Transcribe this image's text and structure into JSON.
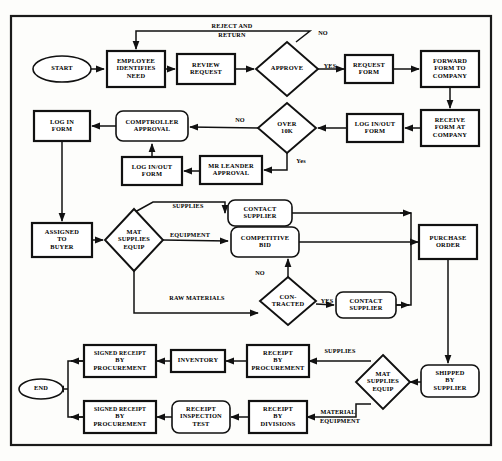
{
  "diagram": {
    "frame": {
      "x": 11,
      "y": 16,
      "w": 480,
      "h": 429
    },
    "colors": {
      "stroke": "#111111",
      "fill": "#ffffff",
      "background": "#fdfdfb"
    },
    "nodes": [
      {
        "id": "start",
        "type": "terminator",
        "cx": 62,
        "cy": 69,
        "w": 58,
        "h": 26,
        "lines": [
          "START"
        ]
      },
      {
        "id": "employee",
        "type": "process",
        "cx": 136,
        "cy": 69,
        "w": 58,
        "h": 36,
        "lines": [
          "EMPLOYEE",
          "IDENTIFIES",
          "NEED"
        ]
      },
      {
        "id": "review",
        "type": "process",
        "cx": 206,
        "cy": 69,
        "w": 58,
        "h": 30,
        "lines": [
          "REVIEW",
          "REQUEST"
        ]
      },
      {
        "id": "approve",
        "type": "decision",
        "cx": 287,
        "cy": 69,
        "w": 62,
        "h": 54,
        "lines": [
          "APPROVE"
        ]
      },
      {
        "id": "requestform",
        "type": "process",
        "cx": 369,
        "cy": 69,
        "w": 48,
        "h": 28,
        "lines": [
          "REQUEST",
          "FORM"
        ]
      },
      {
        "id": "forwardform",
        "type": "process",
        "cx": 450,
        "cy": 69,
        "w": 58,
        "h": 36,
        "lines": [
          "FORWARD",
          "FORM TO",
          "COMPANY"
        ]
      },
      {
        "id": "receiveform",
        "type": "process",
        "cx": 450,
        "cy": 128,
        "w": 58,
        "h": 36,
        "lines": [
          "RECEIVE",
          "FORM AT",
          "COMPANY"
        ]
      },
      {
        "id": "loginout1",
        "type": "process",
        "cx": 375,
        "cy": 128,
        "w": 56,
        "h": 28,
        "lines": [
          "LOG IN/OUT",
          "FORM"
        ]
      },
      {
        "id": "over10k",
        "type": "decision",
        "cx": 287,
        "cy": 128,
        "w": 58,
        "h": 50,
        "lines": [
          "OVER",
          "10K"
        ]
      },
      {
        "id": "comptroller",
        "type": "rounded",
        "cx": 152,
        "cy": 126,
        "w": 72,
        "h": 30,
        "lines": [
          "COMPTROLLER",
          "APPROVAL"
        ]
      },
      {
        "id": "loginform",
        "type": "process",
        "cx": 62,
        "cy": 126,
        "w": 56,
        "h": 30,
        "lines": [
          "LOG IN",
          "FORM"
        ]
      },
      {
        "id": "leander",
        "type": "process",
        "cx": 231,
        "cy": 170,
        "w": 62,
        "h": 28,
        "lines": [
          "MR LEANDER",
          "APPROVAL"
        ]
      },
      {
        "id": "loginout2",
        "type": "process",
        "cx": 152,
        "cy": 171,
        "w": 60,
        "h": 28,
        "lines": [
          "LOG IN/OUT",
          "FORM"
        ]
      },
      {
        "id": "assigned",
        "type": "process",
        "cx": 62,
        "cy": 240,
        "w": 60,
        "h": 34,
        "lines": [
          "ASSIGNED",
          "TO",
          "BUYER"
        ]
      },
      {
        "id": "matsup1",
        "type": "decision",
        "cx": 134,
        "cy": 240,
        "w": 58,
        "h": 62,
        "lines": [
          "MAT",
          "SUPPLIES",
          "EQUIP"
        ]
      },
      {
        "id": "contactsup1",
        "type": "rounded",
        "cx": 260,
        "cy": 213,
        "w": 64,
        "h": 26,
        "lines": [
          "CONTACT",
          "SUPPLIER"
        ]
      },
      {
        "id": "compbid",
        "type": "rounded",
        "cx": 265,
        "cy": 242,
        "w": 68,
        "h": 30,
        "lines": [
          "COMPETITIVE",
          "BID"
        ]
      },
      {
        "id": "contracted",
        "type": "decision",
        "cx": 288,
        "cy": 301,
        "w": 56,
        "h": 48,
        "lines": [
          "CON-",
          "TRACTED"
        ]
      },
      {
        "id": "contactsup2",
        "type": "rounded",
        "cx": 366,
        "cy": 305,
        "w": 60,
        "h": 26,
        "lines": [
          "CONTACT",
          "SUPPLIER"
        ]
      },
      {
        "id": "purchase",
        "type": "process",
        "cx": 448,
        "cy": 242,
        "w": 58,
        "h": 34,
        "lines": [
          "PURCHASE",
          "ORDER"
        ]
      },
      {
        "id": "shipped",
        "type": "rounded",
        "cx": 450,
        "cy": 381,
        "w": 58,
        "h": 32,
        "lines": [
          "SHIPPED",
          "BY",
          "SUPPLIER"
        ]
      },
      {
        "id": "matsup2",
        "type": "decision",
        "cx": 383,
        "cy": 382,
        "w": 54,
        "h": 54,
        "lines": [
          "MAT",
          "SUPPLIES",
          "EQUIP"
        ]
      },
      {
        "id": "receiptproc",
        "type": "process",
        "cx": 278,
        "cy": 361,
        "w": 62,
        "h": 32,
        "lines": [
          "RECEIPT",
          "BY",
          "PROCUREMENT"
        ]
      },
      {
        "id": "inventory",
        "type": "process",
        "cx": 198,
        "cy": 361,
        "w": 54,
        "h": 22,
        "lines": [
          "INVENTORY"
        ]
      },
      {
        "id": "signed1",
        "type": "process",
        "cx": 120,
        "cy": 361,
        "w": 72,
        "h": 32,
        "lines": [
          "SIGNED RECEIPT",
          "BY",
          "PROCUREMENT"
        ]
      },
      {
        "id": "receiptdiv",
        "type": "process",
        "cx": 278,
        "cy": 417,
        "w": 58,
        "h": 32,
        "lines": [
          "RECEIPT",
          "BY",
          "DIVISIONS"
        ]
      },
      {
        "id": "inspection",
        "type": "rounded",
        "cx": 201,
        "cy": 417,
        "w": 58,
        "h": 32,
        "lines": [
          "RECEIPT",
          "INSPECTION",
          "TEST"
        ]
      },
      {
        "id": "signed2",
        "type": "process",
        "cx": 120,
        "cy": 417,
        "w": 72,
        "h": 32,
        "lines": [
          "SIGNED RECEIPT",
          "BY",
          "PROCUREMENT"
        ]
      },
      {
        "id": "end",
        "type": "terminator",
        "cx": 41,
        "cy": 389,
        "w": 44,
        "h": 20,
        "lines": [
          "END"
        ]
      }
    ],
    "edge_labels": [
      {
        "id": "reject-return",
        "x": 232,
        "y": 27,
        "text": "REJECT AND"
      },
      {
        "id": "reject-return2",
        "x": 232,
        "y": 36,
        "text": "RETURN"
      },
      {
        "id": "approve-no",
        "x": 323,
        "y": 34,
        "text": "NO"
      },
      {
        "id": "approve-yes",
        "x": 330,
        "y": 67,
        "text": "YES"
      },
      {
        "id": "over10k-no",
        "x": 240,
        "y": 121,
        "text": "NO"
      },
      {
        "id": "over10k-yes",
        "x": 301,
        "y": 162,
        "text": "Yes"
      },
      {
        "id": "supplies-1",
        "x": 188,
        "y": 207,
        "text": "SUPPLIES"
      },
      {
        "id": "equipment-1",
        "x": 190,
        "y": 236,
        "text": "EQUIPMENT"
      },
      {
        "id": "rawmaterials",
        "x": 197,
        "y": 299,
        "text": "RAW MATERIALS"
      },
      {
        "id": "contracted-no",
        "x": 260,
        "y": 274,
        "text": "NO"
      },
      {
        "id": "contracted-yes",
        "x": 327,
        "y": 302,
        "text": "YES"
      },
      {
        "id": "supplies-2",
        "x": 340,
        "y": 352,
        "text": "SUPPLIES"
      },
      {
        "id": "material-2",
        "x": 338,
        "y": 413,
        "text": "MATERIAL"
      },
      {
        "id": "equipment-2",
        "x": 340,
        "y": 422,
        "text": "EQUIPMENT"
      }
    ]
  }
}
